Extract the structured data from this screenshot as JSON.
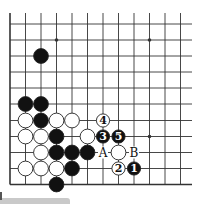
{
  "diagram": {
    "type": "go-board-partial",
    "board_edges": [
      "left",
      "bottom"
    ],
    "columns": 12,
    "rows": 11,
    "grid": {
      "col_x": [
        10,
        25.5,
        41,
        56.5,
        72,
        87.5,
        103,
        118.5,
        134,
        149.5,
        165,
        180.5
      ],
      "row_y": [
        24,
        40,
        56,
        72,
        88,
        104,
        120.5,
        136.5,
        152.5,
        168.5,
        184.5
      ],
      "top_open_y": 13,
      "right_open_x": 192
    },
    "star_points": [
      {
        "col": 3,
        "row": 1
      },
      {
        "col": 9,
        "row": 1
      },
      {
        "col": 9,
        "row": 7
      }
    ],
    "stones": [
      {
        "color": "black",
        "col": 2,
        "row": 2
      },
      {
        "color": "black",
        "col": 1,
        "row": 5
      },
      {
        "color": "black",
        "col": 2,
        "row": 5
      },
      {
        "color": "white",
        "col": 1,
        "row": 6
      },
      {
        "color": "black",
        "col": 2,
        "row": 6
      },
      {
        "color": "white",
        "col": 3,
        "row": 6
      },
      {
        "color": "white",
        "col": 4,
        "row": 6
      },
      {
        "color": "white",
        "col": 1,
        "row": 7
      },
      {
        "color": "white",
        "col": 2,
        "row": 7
      },
      {
        "color": "black",
        "col": 3,
        "row": 7
      },
      {
        "color": "white",
        "col": 5,
        "row": 7
      },
      {
        "color": "white",
        "col": 2,
        "row": 8
      },
      {
        "color": "black",
        "col": 3,
        "row": 8
      },
      {
        "color": "black",
        "col": 4,
        "row": 8
      },
      {
        "color": "black",
        "col": 5,
        "row": 8
      },
      {
        "color": "white",
        "col": 7,
        "row": 8
      },
      {
        "color": "white",
        "col": 1,
        "row": 9
      },
      {
        "color": "white",
        "col": 2,
        "row": 9
      },
      {
        "color": "white",
        "col": 3,
        "row": 9
      },
      {
        "color": "black",
        "col": 4,
        "row": 9
      },
      {
        "color": "black",
        "col": 3,
        "row": 10
      }
    ],
    "numbered_moves": [
      {
        "number": "1",
        "color": "black",
        "col": 8,
        "row": 9
      },
      {
        "number": "2",
        "color": "white",
        "col": 7,
        "row": 9
      },
      {
        "number": "3",
        "color": "black",
        "col": 6,
        "row": 7
      },
      {
        "number": "4",
        "color": "white",
        "col": 6,
        "row": 6
      },
      {
        "number": "5",
        "color": "black",
        "col": 7,
        "row": 7
      }
    ],
    "point_labels": [
      {
        "text": "A",
        "col": 6,
        "row": 8
      },
      {
        "text": "B",
        "col": 8,
        "row": 8
      }
    ],
    "colors": {
      "line": "#333333",
      "black_stone": "#111111",
      "white_stone": "#ffffff",
      "stone_outline": "#222222",
      "background": "#ffffff"
    }
  }
}
